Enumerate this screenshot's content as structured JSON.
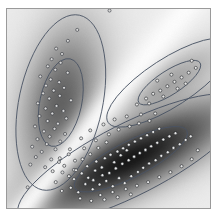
{
  "figure": {
    "title": "",
    "width": 219,
    "height": 220,
    "background": "#ffffff",
    "frame": {
      "x": 6,
      "y": 8,
      "width": 205,
      "height": 201,
      "border_color": "#9a9a9a"
    }
  },
  "chart_data": {
    "type": "scatter",
    "title": "",
    "subtitle": "",
    "xlabel": "",
    "ylabel": "",
    "xlim": [
      0,
      100
    ],
    "ylim": [
      0,
      100
    ],
    "grid": false,
    "legend": "none",
    "axes_visible": false,
    "tick_labels_x": [],
    "tick_labels_y": [],
    "colormap": {
      "name": "grayscale-density",
      "low": "#ffffff",
      "mid": "#b4b4b4",
      "high": "#242424",
      "separator_band": "#fbfbfb"
    },
    "marker": {
      "shape": "circle-open",
      "size_px": 3.1,
      "fill": "#dcdcdc",
      "edge": "#20242a"
    },
    "contour": {
      "stroke": "#4a5464",
      "stroke_width": 0.9,
      "levels": [
        1,
        2
      ],
      "level_meaning": "1-sigma inner ellipse, 2-sigma outer ellipse"
    },
    "series": [
      {
        "name": "Cluster 1",
        "n_points": 48,
        "center": [
          26.5,
          53.0
        ],
        "orientation_deg": 78,
        "sigma_major": 22.0,
        "sigma_minor": 10.5,
        "density_peak": "#9e9e9e",
        "points": [
          [
            34.6,
            89.5
          ],
          [
            30.0,
            84.0
          ],
          [
            24.2,
            80.1
          ],
          [
            27.1,
            77.4
          ],
          [
            22.0,
            74.8
          ],
          [
            26.4,
            73.0
          ],
          [
            20.1,
            71.2
          ],
          [
            23.8,
            69.5
          ],
          [
            29.9,
            68.0
          ],
          [
            16.4,
            66.1
          ],
          [
            21.5,
            64.6
          ],
          [
            25.7,
            63.2
          ],
          [
            19.2,
            61.5
          ],
          [
            28.1,
            60.4
          ],
          [
            23.0,
            59.0
          ],
          [
            17.8,
            57.6
          ],
          [
            26.0,
            56.4
          ],
          [
            20.8,
            55.0
          ],
          [
            31.5,
            54.1
          ],
          [
            15.2,
            52.6
          ],
          [
            24.4,
            51.3
          ],
          [
            19.0,
            50.0
          ],
          [
            27.8,
            48.8
          ],
          [
            22.3,
            47.5
          ],
          [
            16.0,
            46.2
          ],
          [
            29.2,
            45.0
          ],
          [
            20.0,
            43.7
          ],
          [
            25.1,
            42.4
          ],
          [
            13.8,
            41.0
          ],
          [
            23.4,
            39.8
          ],
          [
            18.2,
            38.5
          ],
          [
            28.6,
            37.2
          ],
          [
            21.0,
            35.9
          ],
          [
            15.0,
            34.6
          ],
          [
            26.2,
            33.4
          ],
          [
            19.6,
            32.1
          ],
          [
            12.4,
            30.8
          ],
          [
            23.9,
            29.5
          ],
          [
            17.1,
            28.2
          ],
          [
            30.4,
            27.0
          ],
          [
            14.2,
            25.6
          ],
          [
            21.8,
            24.4
          ],
          [
            25.6,
            23.1
          ],
          [
            11.5,
            21.8
          ],
          [
            18.8,
            20.5
          ],
          [
            33.0,
            19.2
          ],
          [
            27.3,
            17.9
          ],
          [
            10.2,
            10.4
          ]
        ]
      },
      {
        "name": "Cluster 2",
        "n_points": 96,
        "center": [
          61.0,
          24.5
        ],
        "orientation_deg": 27,
        "sigma_major": 31.0,
        "sigma_minor": 9.0,
        "density_peak": "#242424",
        "points": [
          [
            27.0,
            8.6
          ],
          [
            31.4,
            10.2
          ],
          [
            35.1,
            7.9
          ],
          [
            38.6,
            12.0
          ],
          [
            33.0,
            14.5
          ],
          [
            42.2,
            9.4
          ],
          [
            40.0,
            15.2
          ],
          [
            45.6,
            11.8
          ],
          [
            36.8,
            17.4
          ],
          [
            48.9,
            13.6
          ],
          [
            43.4,
            18.8
          ],
          [
            52.1,
            10.9
          ],
          [
            39.5,
            21.0
          ],
          [
            55.2,
            15.0
          ],
          [
            46.7,
            20.4
          ],
          [
            50.4,
            17.6
          ],
          [
            58.0,
            12.5
          ],
          [
            44.0,
            23.4
          ],
          [
            53.6,
            19.9
          ],
          [
            61.2,
            16.0
          ],
          [
            48.2,
            25.0
          ],
          [
            56.8,
            22.2
          ],
          [
            64.5,
            18.1
          ],
          [
            51.0,
            26.8
          ],
          [
            59.9,
            24.0
          ],
          [
            67.1,
            20.2
          ],
          [
            54.4,
            28.4
          ],
          [
            62.6,
            25.8
          ],
          [
            70.0,
            22.4
          ],
          [
            57.2,
            30.0
          ],
          [
            65.4,
            27.6
          ],
          [
            73.2,
            24.0
          ],
          [
            60.0,
            31.8
          ],
          [
            68.2,
            29.2
          ],
          [
            76.0,
            26.2
          ],
          [
            63.0,
            33.4
          ],
          [
            71.0,
            31.0
          ],
          [
            79.2,
            28.0
          ],
          [
            66.0,
            35.0
          ],
          [
            74.0,
            32.8
          ],
          [
            82.0,
            30.2
          ],
          [
            69.0,
            36.6
          ],
          [
            77.0,
            34.4
          ],
          [
            85.1,
            32.0
          ],
          [
            72.0,
            38.2
          ],
          [
            80.0,
            36.0
          ],
          [
            88.0,
            34.2
          ],
          [
            75.0,
            39.8
          ],
          [
            83.0,
            37.6
          ],
          [
            90.5,
            36.0
          ],
          [
            34.0,
            19.0
          ],
          [
            37.2,
            24.5
          ],
          [
            41.0,
            27.0
          ],
          [
            45.0,
            30.2
          ],
          [
            49.0,
            33.0
          ],
          [
            42.5,
            14.0
          ],
          [
            47.0,
            16.5
          ],
          [
            52.8,
            23.0
          ],
          [
            56.0,
            26.5
          ],
          [
            59.0,
            29.0
          ],
          [
            30.5,
            16.0
          ],
          [
            28.2,
            21.2
          ],
          [
            33.5,
            23.8
          ],
          [
            38.0,
            30.0
          ],
          [
            43.8,
            34.0
          ],
          [
            50.2,
            37.0
          ],
          [
            55.0,
            39.4
          ],
          [
            60.4,
            41.0
          ],
          [
            65.0,
            42.5
          ],
          [
            70.2,
            43.8
          ],
          [
            46.0,
            6.5
          ],
          [
            52.0,
            8.0
          ],
          [
            58.5,
            9.5
          ],
          [
            64.0,
            11.2
          ],
          [
            69.5,
            13.0
          ],
          [
            75.0,
            15.5
          ],
          [
            80.5,
            18.0
          ],
          [
            86.0,
            21.0
          ],
          [
            91.0,
            24.5
          ],
          [
            94.0,
            29.0
          ],
          [
            36.0,
            4.8
          ],
          [
            41.5,
            3.6
          ],
          [
            48.0,
            4.2
          ],
          [
            54.5,
            5.4
          ],
          [
            61.0,
            6.8
          ],
          [
            24.0,
            13.0
          ],
          [
            22.5,
            18.5
          ],
          [
            26.0,
            25.0
          ],
          [
            31.0,
            29.5
          ],
          [
            36.5,
            35.0
          ],
          [
            41.0,
            39.0
          ],
          [
            47.5,
            42.0
          ],
          [
            53.0,
            44.5
          ],
          [
            59.0,
            46.0
          ],
          [
            66.0,
            47.0
          ],
          [
            73.0,
            47.5
          ]
        ]
      },
      {
        "name": "Cluster 3",
        "n_points": 16,
        "center": [
          80.0,
          63.0
        ],
        "orientation_deg": 33,
        "sigma_major": 18.0,
        "sigma_minor": 6.0,
        "density_peak": "#3a3a3a",
        "points": [
          [
            64.0,
            52.0
          ],
          [
            68.5,
            55.0
          ],
          [
            72.0,
            57.4
          ],
          [
            75.5,
            59.0
          ],
          [
            79.0,
            61.2
          ],
          [
            82.5,
            63.4
          ],
          [
            86.0,
            65.6
          ],
          [
            89.5,
            68.0
          ],
          [
            93.0,
            70.4
          ],
          [
            70.0,
            52.5
          ],
          [
            77.0,
            56.0
          ],
          [
            84.0,
            60.0
          ],
          [
            88.0,
            62.5
          ],
          [
            74.0,
            64.0
          ],
          [
            81.0,
            67.0
          ],
          [
            91.0,
            74.0
          ]
        ]
      }
    ],
    "annotations": [
      {
        "label": "stray-point-top",
        "x": 50.5,
        "y": 99.2
      }
    ]
  }
}
